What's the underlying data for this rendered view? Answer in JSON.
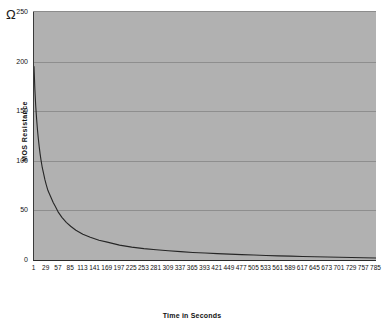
{
  "chart_data": {
    "type": "line",
    "title": "",
    "xlabel": "Time in Seconds",
    "ylabel": "MOS Resistance",
    "yunit": "Ω",
    "ylim": [
      0,
      250
    ],
    "xlim": [
      1,
      785
    ],
    "grid": true,
    "legend": "none",
    "yticks": [
      250,
      200,
      150,
      100,
      50,
      0
    ],
    "ytick_labels": [
      "250",
      "200",
      "150",
      "100",
      "50",
      "0"
    ],
    "xticks": [
      1,
      29,
      57,
      85,
      113,
      141,
      169,
      197,
      225,
      253,
      281,
      309,
      337,
      365,
      393,
      421,
      449,
      477,
      505,
      533,
      561,
      589,
      617,
      645,
      673,
      701,
      729,
      757,
      785
    ],
    "xtick_labels": [
      "1",
      "29",
      "57",
      "85",
      "113",
      "141",
      "169",
      "197",
      "225",
      "253",
      "281",
      "309",
      "337",
      "365",
      "393",
      "421",
      "449",
      "477",
      "505",
      "533",
      "561",
      "589",
      "617",
      "645",
      "673",
      "701",
      "729",
      "757",
      "785"
    ],
    "series": [
      {
        "name": "MOS Resistance",
        "color": "#262626",
        "x": [
          1,
          3,
          5,
          7,
          9,
          11,
          13,
          15,
          17,
          20,
          23,
          26,
          29,
          33,
          37,
          41,
          45,
          50,
          57,
          65,
          75,
          85,
          97,
          113,
          130,
          150,
          169,
          197,
          225,
          253,
          281,
          309,
          337,
          365,
          393,
          421,
          449,
          477,
          505,
          533,
          561,
          589,
          617,
          645,
          673,
          701,
          729,
          757,
          785
        ],
        "values": [
          195,
          172,
          155,
          142,
          131,
          122,
          114,
          107,
          101,
          93,
          87,
          81,
          76,
          70,
          66,
          62,
          58,
          54,
          48,
          43,
          38,
          34,
          30,
          26,
          23,
          20,
          18,
          15,
          13,
          11.5,
          10.3,
          9.3,
          8.4,
          7.6,
          7.0,
          6.4,
          5.9,
          5.4,
          5.0,
          4.6,
          4.2,
          3.9,
          3.6,
          3.3,
          3.0,
          2.8,
          2.5,
          2.3,
          2.0
        ]
      }
    ]
  },
  "style": {
    "plot_background": "#b1b1b1",
    "page_background": "#ffffff",
    "gridline_color": "#8e8e8e",
    "axis_color": "#2a2a2a",
    "curve_color": "#262626",
    "text_color": "#111111"
  }
}
